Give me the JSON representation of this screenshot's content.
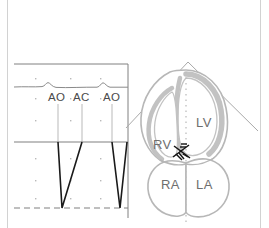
{
  "figure": {
    "width": 269,
    "height": 228,
    "background": "#ffffff",
    "edge_rule_color": "#d2d2d2"
  },
  "colors": {
    "trace_black": "#1a1a1a",
    "frame_gray": "#808080",
    "ecg_gray": "#8a8a8a",
    "grid_dot_gray": "#b9b9b9",
    "heart_outline": "#b7b7b7",
    "heart_wall": "#c2c2c2",
    "sector_line": "#a9a9a9",
    "midline_dot": "#bdbdbd",
    "label_gray": "#6e6e6e",
    "label_dark": "#4a4a4a",
    "cursor_marker": "#141414"
  },
  "mmode_panel": {
    "name": "aortic-valve-m-mode-tracing",
    "frame": {
      "x": 14,
      "y": 64,
      "width": 114,
      "height": 154
    },
    "ecg_trace": {
      "name": "ecg-surface-trace",
      "baseline_y": 86,
      "bumps_x": [
        48,
        103
      ]
    },
    "zero_line_y": 142,
    "dashed_baseline_y": 208,
    "event_labels": [
      {
        "text": "AO",
        "x": 48,
        "y": 92,
        "cursor_x": 58,
        "cursor_top": 104,
        "cursor_bottom": 142
      },
      {
        "text": "AC",
        "x": 73,
        "y": 92,
        "cursor_x": 82,
        "cursor_top": 104,
        "cursor_bottom": 142
      },
      {
        "text": "AO",
        "x": 103,
        "y": 92,
        "cursor_x": 112,
        "cursor_top": 104,
        "cursor_bottom": 142
      }
    ],
    "doppler_spikes": [
      {
        "name": "doppler-spike-1",
        "start_x": 58,
        "apex_x": 62,
        "end_x": 82
      },
      {
        "name": "doppler-spike-2",
        "start_x": 112,
        "apex_x": 120,
        "end_x": 127
      }
    ],
    "grid_dots_x": [
      35,
      70,
      100
    ],
    "grid_dots_y": [
      78,
      98,
      120,
      158,
      180,
      198
    ]
  },
  "heart_panel": {
    "name": "apical-four-chamber-heart-diagram",
    "sector": {
      "name": "ultrasound-sector-beam",
      "apex_x": 188,
      "apex_y": 62,
      "left_end_x": 126,
      "left_end_y": 128,
      "right_end_x": 258,
      "right_end_y": 131
    },
    "midline": {
      "name": "m-mode-cursor-midline",
      "x": 186,
      "top_y": 72,
      "bottom_y": 222
    },
    "cursor_marker": {
      "name": "valve-cursor-marker",
      "x": 180,
      "y": 152
    },
    "chamber_labels": [
      {
        "text": "LV",
        "name": "chamber-label-lv",
        "x": 196,
        "y": 116
      },
      {
        "text": "RV",
        "name": "chamber-label-rv",
        "x": 153,
        "y": 138
      },
      {
        "text": "RA",
        "name": "chamber-label-ra",
        "x": 161,
        "y": 178
      },
      {
        "text": "LA",
        "name": "chamber-label-la",
        "x": 196,
        "y": 178
      }
    ]
  }
}
